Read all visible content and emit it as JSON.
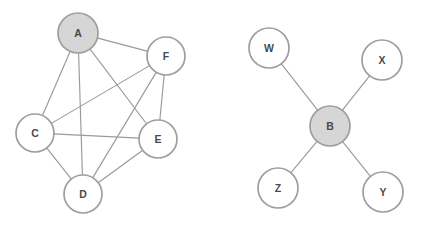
{
  "figure": {
    "background_color": "#ffffff",
    "width": 422,
    "height": 225
  },
  "style": {
    "edge_color": "#9a9a9a",
    "edge_width": 1.15,
    "node_stroke_color": "#9e9e9e",
    "node_stroke_width": 1.7,
    "node_fill_default": "#ffffff",
    "node_fill_highlight": "#d6d6d6",
    "label_color": "#4a4a4a",
    "label_font_size": 10.5
  },
  "graphs": [
    {
      "id": "left-graph",
      "name": "dense-graph",
      "node_count": 6,
      "edge_count": 10,
      "highlighted_node": "A",
      "nodes": [
        {
          "id": "A",
          "label": "A",
          "cx": 78,
          "cy": 33,
          "r": 20,
          "highlighted": true
        },
        {
          "id": "F",
          "label": "F",
          "cx": 166,
          "cy": 56,
          "r": 19,
          "highlighted": false
        },
        {
          "id": "C",
          "label": "C",
          "cx": 35,
          "cy": 133,
          "r": 19,
          "highlighted": false
        },
        {
          "id": "E",
          "label": "E",
          "cx": 158,
          "cy": 139,
          "r": 19,
          "highlighted": false
        },
        {
          "id": "D",
          "label": "D",
          "cx": 83,
          "cy": 194,
          "r": 19,
          "highlighted": false
        }
      ],
      "edges": [
        {
          "from": "A",
          "to": "F"
        },
        {
          "from": "A",
          "to": "C"
        },
        {
          "from": "A",
          "to": "D"
        },
        {
          "from": "A",
          "to": "E"
        },
        {
          "from": "C",
          "to": "F"
        },
        {
          "from": "C",
          "to": "E"
        },
        {
          "from": "C",
          "to": "D"
        },
        {
          "from": "D",
          "to": "F"
        },
        {
          "from": "D",
          "to": "E"
        },
        {
          "from": "E",
          "to": "F"
        }
      ]
    },
    {
      "id": "right-graph",
      "name": "star-graph",
      "node_count": 5,
      "edge_count": 4,
      "highlighted_node": "B",
      "nodes": [
        {
          "id": "W",
          "label": "W",
          "cx": 269,
          "cy": 48,
          "r": 20,
          "highlighted": false
        },
        {
          "id": "X",
          "label": "X",
          "cx": 382,
          "cy": 60,
          "r": 20,
          "highlighted": false
        },
        {
          "id": "B",
          "label": "B",
          "cx": 330,
          "cy": 126,
          "r": 20,
          "highlighted": true
        },
        {
          "id": "Z",
          "label": "Z",
          "cx": 278,
          "cy": 188,
          "r": 20,
          "highlighted": false
        },
        {
          "id": "Y",
          "label": "Y",
          "cx": 383,
          "cy": 192,
          "r": 20,
          "highlighted": false
        }
      ],
      "edges": [
        {
          "from": "B",
          "to": "W"
        },
        {
          "from": "B",
          "to": "X"
        },
        {
          "from": "B",
          "to": "Z"
        },
        {
          "from": "B",
          "to": "Y"
        }
      ]
    }
  ]
}
